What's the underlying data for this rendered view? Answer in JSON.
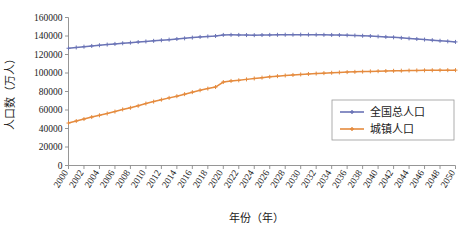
{
  "chart_data": {
    "type": "line",
    "title": "",
    "xlabel": "年份（年）",
    "ylabel": "人口数（万人）",
    "xlim": [
      2000,
      2050
    ],
    "ylim": [
      0,
      160000
    ],
    "ytick_step": 20000,
    "xtick_step": 2,
    "grid": false,
    "legend_position": "center-right",
    "x": [
      2000,
      2001,
      2002,
      2003,
      2004,
      2005,
      2006,
      2007,
      2008,
      2009,
      2010,
      2011,
      2012,
      2013,
      2014,
      2015,
      2016,
      2017,
      2018,
      2019,
      2020,
      2021,
      2022,
      2023,
      2024,
      2025,
      2026,
      2027,
      2028,
      2029,
      2030,
      2031,
      2032,
      2033,
      2034,
      2035,
      2036,
      2037,
      2038,
      2039,
      2040,
      2041,
      2042,
      2043,
      2044,
      2045,
      2046,
      2047,
      2048,
      2049,
      2050
    ],
    "xtick_labels": [
      "2000",
      "2002",
      "2004",
      "2006",
      "2008",
      "2010",
      "2012",
      "2014",
      "2016",
      "2018",
      "2020",
      "2022",
      "2024",
      "2026",
      "2028",
      "2030",
      "2032",
      "2034",
      "2036",
      "2038",
      "2040",
      "2042",
      "2044",
      "2046",
      "2048",
      "2050"
    ],
    "ytick_labels": [
      "0",
      "20000",
      "40000",
      "60000",
      "80000",
      "100000",
      "120000",
      "140000",
      "160000"
    ],
    "series": [
      {
        "name": "全国总人口",
        "color": "#6b74b6",
        "marker": "plus",
        "values": [
          126743,
          127627,
          128453,
          129227,
          129988,
          130756,
          131448,
          132129,
          132802,
          133450,
          134091,
          134735,
          135404,
          136072,
          136782,
          137462,
          138271,
          139008,
          139538,
          140005,
          141178,
          141260,
          141175,
          141000,
          140900,
          141050,
          141200,
          141300,
          141400,
          141450,
          141480,
          141450,
          141400,
          141300,
          141150,
          141000,
          140800,
          140550,
          140250,
          139900,
          139500,
          139050,
          138550,
          138000,
          137400,
          136800,
          136150,
          135500,
          134850,
          134200,
          133600
        ]
      },
      {
        "name": "城镇人口",
        "color": "#e58b3e",
        "marker": "plus",
        "values": [
          45906,
          48064,
          50212,
          52376,
          54283,
          56212,
          58288,
          60633,
          62403,
          64512,
          66978,
          69079,
          71182,
          73111,
          74916,
          77116,
          79298,
          81347,
          83137,
          84843,
          90220,
          91425,
          92071,
          93100,
          94100,
          95000,
          95850,
          96600,
          97300,
          97900,
          98450,
          98950,
          99400,
          99850,
          100250,
          100600,
          100950,
          101250,
          101500,
          101750,
          101950,
          102150,
          102350,
          102500,
          102650,
          102780,
          102880,
          102960,
          103020,
          103060,
          103100
        ]
      }
    ]
  },
  "legend": {
    "entries": [
      {
        "label": "全国总人口"
      },
      {
        "label": "城镇人口"
      }
    ]
  }
}
